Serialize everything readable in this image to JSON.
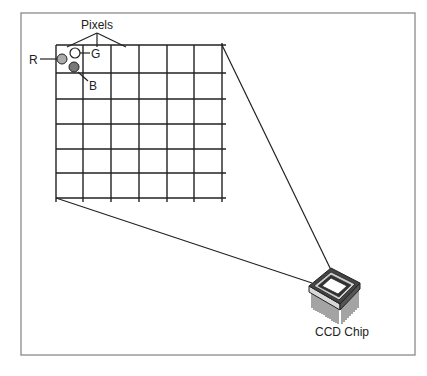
{
  "diagram": {
    "title_label": "Pixels",
    "channel_labels": {
      "red": "R",
      "green": "G",
      "blue": "B"
    },
    "chip_label": "CCD Chip",
    "grid": {
      "rows": 6,
      "cols": 6
    },
    "colors": {
      "frame": "#8a8a8a",
      "line": "#222222",
      "red_pixel": "#ababab",
      "green_pixel": "#ffffff",
      "blue_pixel": "#787878"
    }
  }
}
